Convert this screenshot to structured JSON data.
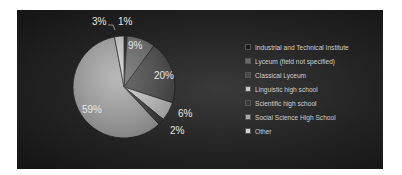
{
  "chart_data": {
    "type": "pie",
    "title": "",
    "categories": [
      "Industrial and Technical Institute",
      "Lyceum (field not specified)",
      "Classical Lyceum",
      "Linguistic high school",
      "Scientific high school",
      "Social Science High School",
      "Other"
    ],
    "values": [
      1,
      9,
      20,
      6,
      2,
      59,
      3
    ],
    "labels": [
      "1%",
      "9%",
      "20%",
      "6%",
      "2%",
      "59%",
      "3%"
    ],
    "colors": [
      "#1a1a1a",
      "#6a6a6a",
      "#4a4a4a",
      "#c8c8c8",
      "#3a3a3a",
      "#a9a9a9",
      "#d0d0d0"
    ],
    "legend_position": "right",
    "start_angle_deg": 0,
    "direction": "clockwise"
  },
  "legend": {
    "items": [
      "Industrial and Technical Institute",
      "Lyceum (field not specified)",
      "Classical Lyceum",
      "Linguistic high school",
      "Scientific high school",
      "Social Science High School",
      "Other"
    ]
  },
  "labels": {
    "l1": "1%",
    "l9": "9%",
    "l20": "20%",
    "l6": "6%",
    "l2": "2%",
    "l59": "59%",
    "l3": "3%"
  }
}
